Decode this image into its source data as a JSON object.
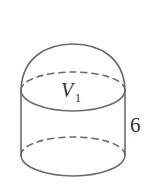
{
  "figure": {
    "volume_label": {
      "symbol": "V",
      "subscript": "1"
    },
    "height_label": "6",
    "colors": {
      "line": "#6b6b6b",
      "text": "#333333",
      "background": "#ffffff"
    }
  }
}
